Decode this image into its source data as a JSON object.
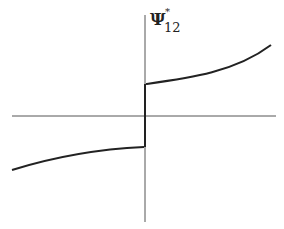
{
  "diagram": {
    "type": "function-plot",
    "label": {
      "symbol": "Ψ",
      "superscript": "*",
      "subscript": "12"
    },
    "colors": {
      "axis": "#555555",
      "curve": "#222222",
      "background": "#ffffff"
    },
    "axes": {
      "vertical": {
        "x": 145,
        "y1": 15,
        "y2": 222
      },
      "horizontal": {
        "y": 116,
        "x1": 12,
        "x2": 276
      }
    },
    "curves": {
      "left_branch": "M 12 170 C 60 155, 100 149, 144 147",
      "right_branch": "M 146 84 C 190 78, 235 72, 271 45",
      "jump": "M 145 147 L 145 84"
    }
  }
}
